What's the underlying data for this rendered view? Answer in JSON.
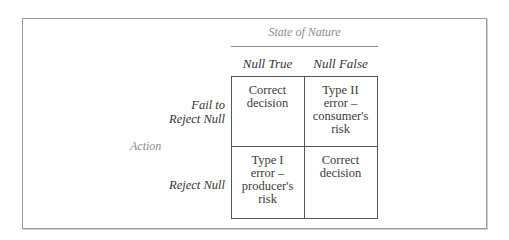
{
  "diagram": {
    "column_axis_label": "State of Nature",
    "row_axis_label": "Action",
    "columns": [
      {
        "label": "Null True"
      },
      {
        "label": "Null False"
      }
    ],
    "rows": [
      {
        "label_lines": [
          "Fail to",
          "Reject Null"
        ],
        "cells": [
          {
            "lines": [
              "Correct",
              "decision"
            ]
          },
          {
            "lines": [
              "Type II",
              "error –",
              "consumer's",
              "risk"
            ]
          }
        ]
      },
      {
        "label_lines": [
          "Reject Null"
        ],
        "cells": [
          {
            "lines": [
              "Type I",
              "error –",
              "producer's",
              "risk"
            ]
          },
          {
            "lines": [
              "Correct",
              "decision"
            ]
          }
        ]
      }
    ]
  },
  "colors": {
    "frame_border": "#9a9a9a",
    "grid_border": "#555555",
    "axis_label_text": "#8c8c8c",
    "body_text": "#3a3a3a"
  }
}
